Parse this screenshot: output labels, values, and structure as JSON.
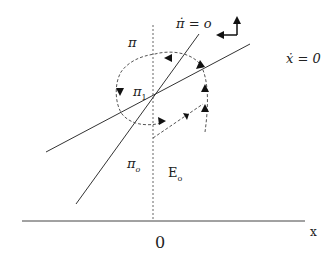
{
  "diagram": {
    "labels": {
      "pi": "π",
      "pi_dot_eq": "π̇ = o",
      "x_dot_eq": "ẋ = 0",
      "pi1": "π",
      "pi1_sub": "1",
      "pio": "π",
      "pio_sub": "o",
      "e0": "E",
      "e0_sub": "o",
      "origin": "0",
      "x_axis": "x"
    },
    "colors": {
      "line": "#333333",
      "dashed": "#555555",
      "background": "#ffffff"
    }
  }
}
